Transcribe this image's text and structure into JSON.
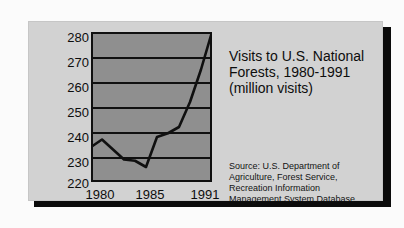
{
  "card": {
    "background_color": "#d2d2d2",
    "plot_background_color": "#8f8f8f",
    "ink_color": "#101010"
  },
  "title": {
    "line1": "Visits to U.S. National",
    "line2": "Forests, 1980-1991",
    "line3": "(million visits)"
  },
  "source": {
    "line1": "Source: U.S. Department of",
    "line2": "Agriculture, Forest Service,",
    "line3": "Recreation Information",
    "line4": "Management System Database"
  },
  "axis": {
    "y_ticks": [
      "280",
      "270",
      "260",
      "250",
      "240",
      "230",
      "220"
    ],
    "x_ticks": [
      "1980",
      "1985",
      "1991"
    ]
  },
  "chart_data": {
    "type": "line",
    "title": "Visits to U.S. National Forests, 1980-1991 (million visits)",
    "xlabel": "",
    "ylabel": "million visits",
    "x": [
      1980,
      1981,
      1982,
      1983,
      1984,
      1985,
      1986,
      1987,
      1988,
      1989,
      1990,
      1991
    ],
    "values": [
      234,
      237,
      233,
      229,
      228.5,
      226,
      238,
      239.5,
      242,
      252,
      265,
      280
    ],
    "series": [
      {
        "name": "Visits to U.S. National Forests",
        "values": [
          234,
          237,
          233,
          229,
          228.5,
          226,
          238,
          239.5,
          242,
          252,
          265,
          280
        ]
      }
    ],
    "xlim": [
      1980,
      1991
    ],
    "ylim": [
      220,
      280
    ],
    "y_ticks": [
      220,
      230,
      240,
      250,
      260,
      270,
      280
    ],
    "x_tick_labels": [
      "1980",
      "1985",
      "1991"
    ],
    "grid": true,
    "legend": "none",
    "line_color": "#101010",
    "annotations": [
      "Source: U.S. Department of Agriculture, Forest Service, Recreation Information Management System Database"
    ]
  }
}
